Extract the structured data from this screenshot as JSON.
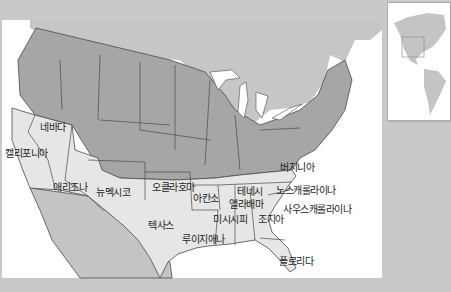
{
  "map": {
    "title": "Southern states of the United States",
    "colors": {
      "background": "#c9c9c9",
      "ocean": "#ffffff",
      "northern_states": "#a6a6a6",
      "southern_states": "#e6e6e6",
      "foreign_land": "#c4c4c4",
      "border": "#4a4a4a"
    },
    "labels": [
      {
        "id": "nevada",
        "text": "네바다",
        "x": 40,
        "y": 122
      },
      {
        "id": "california",
        "text": "캘리포니아",
        "x": 5,
        "y": 148
      },
      {
        "id": "arizona",
        "text": "애리조나",
        "x": 53,
        "y": 182
      },
      {
        "id": "new-mexico",
        "text": "뉴멕시코",
        "x": 96,
        "y": 187
      },
      {
        "id": "oklahoma",
        "text": "오클라호마",
        "x": 152,
        "y": 182
      },
      {
        "id": "arkansas",
        "text": "아칸소",
        "x": 193,
        "y": 193
      },
      {
        "id": "texas",
        "text": "텍사스",
        "x": 148,
        "y": 220
      },
      {
        "id": "louisiana",
        "text": "루이지애나",
        "x": 182,
        "y": 234
      },
      {
        "id": "mississippi",
        "text": "미시시피",
        "x": 213,
        "y": 214
      },
      {
        "id": "tennessee",
        "text": "테네시",
        "x": 237,
        "y": 186
      },
      {
        "id": "alabama",
        "text": "앨라배마",
        "x": 229,
        "y": 199
      },
      {
        "id": "georgia",
        "text": "조지아",
        "x": 258,
        "y": 214
      },
      {
        "id": "florida",
        "text": "플로리다",
        "x": 279,
        "y": 256
      },
      {
        "id": "virginia",
        "text": "버지니아",
        "x": 280,
        "y": 162
      },
      {
        "id": "north-carolina",
        "text": "노스캐롤라이나",
        "x": 276,
        "y": 185
      },
      {
        "id": "south-carolina",
        "text": "사우스캐롤라이나",
        "x": 283,
        "y": 204
      }
    ],
    "inset": {
      "caption": "Americas locator"
    }
  }
}
